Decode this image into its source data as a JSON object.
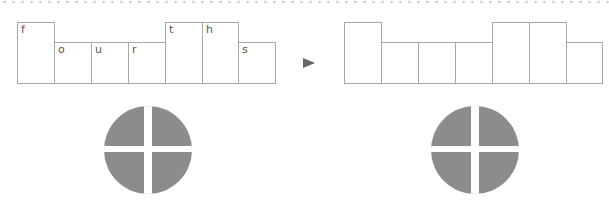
{
  "left_word": {
    "cells": [
      {
        "letter": "f",
        "tall": true
      },
      {
        "letter": "o",
        "tall": false
      },
      {
        "letter": "u",
        "tall": false
      },
      {
        "letter": "r",
        "tall": false
      },
      {
        "letter": "t",
        "tall": true
      },
      {
        "letter": "h",
        "tall": true
      },
      {
        "letter": "s",
        "tall": false
      }
    ]
  },
  "right_word": {
    "cells": [
      {
        "letter": "",
        "tall": true
      },
      {
        "letter": "",
        "tall": false
      },
      {
        "letter": "",
        "tall": false
      },
      {
        "letter": "",
        "tall": false
      },
      {
        "letter": "",
        "tall": true
      },
      {
        "letter": "",
        "tall": true
      },
      {
        "letter": "",
        "tall": false
      }
    ]
  },
  "arrow_icon": "play-triangle-icon",
  "shape_icon": "quartered-circle-icon",
  "colors": {
    "border": "#a8a8a8",
    "fill": "#8c8c8c",
    "arrow": "#666666"
  }
}
